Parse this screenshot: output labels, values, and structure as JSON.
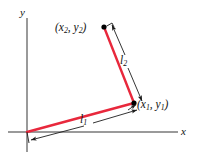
{
  "figure": {
    "axes": {
      "x_label": "x",
      "y_label": "y",
      "origin": [
        27,
        132
      ],
      "x_axis_end": [
        178,
        132
      ],
      "y_axis_top": [
        27,
        18
      ]
    },
    "colors": {
      "link": "#e8283c",
      "dimension": "#1d1d1d",
      "axis": "#8c8c8c",
      "text": "#111111",
      "point": "#000000"
    },
    "points": {
      "origin": {
        "x": 27,
        "y": 132
      },
      "joint": {
        "x": 134,
        "y": 103,
        "label_main": "(x",
        "label_sub": "1",
        "label_mid": ", y",
        "label_sub2": "1",
        "label_end": ")"
      },
      "tip": {
        "x": 104,
        "y": 27,
        "label_main": "(x",
        "label_sub": "2",
        "label_mid": ", y",
        "label_sub2": "2",
        "label_end": ")"
      }
    },
    "labels": {
      "point1": {
        "pre": "(x",
        "sub1": "1",
        "mid": ", y",
        "sub2": "1",
        "post": ")"
      },
      "point2": {
        "pre": "(x",
        "sub1": "2",
        "mid": ", y",
        "sub2": "2",
        "post": ")"
      },
      "length1": {
        "symbol": "l",
        "sub": "1"
      },
      "length2": {
        "symbol": "l",
        "sub": "2"
      }
    },
    "segments": [
      {
        "name": "link-1",
        "from": "origin",
        "to": "joint",
        "length_label": "l1"
      },
      {
        "name": "link-2",
        "from": "joint",
        "to": "tip",
        "length_label": "l2"
      }
    ]
  }
}
